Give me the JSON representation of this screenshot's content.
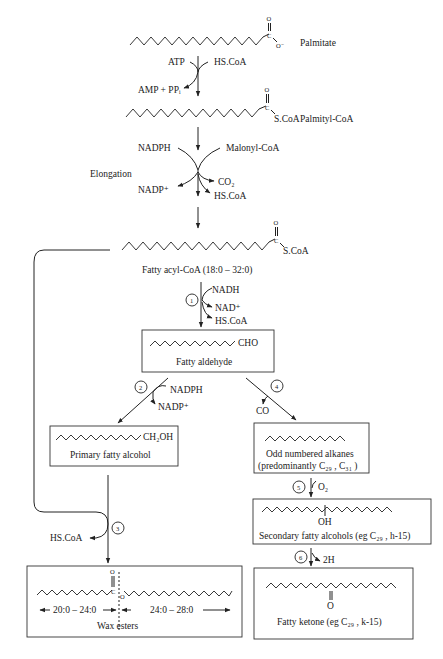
{
  "diagram": {
    "nodes": {
      "palmitate": {
        "label": "Palmitate",
        "group": "O",
        "charge": "O⁻"
      },
      "palmityl_coa": {
        "label": "Palmityl-CoA",
        "group": "S.CoA"
      },
      "fatty_acyl_coa": {
        "label": "Fatty acyl-CoA  (18:0 – 32:0)",
        "group": "S.CoA"
      },
      "fatty_aldehyde": {
        "label": "Fatty aldehyde",
        "group": "CHO"
      },
      "primary_alcohol": {
        "label": "Primary fatty alcohol",
        "group": "CH₂OH"
      },
      "alkanes": {
        "label": "Odd numbered alkanes",
        "sublabel": "(predominantly C₂₉ , C₃₁ )"
      },
      "secondary_alcohols": {
        "label": "Secondary fatty alcohols (eg C₂₉ , h-15)",
        "group": "OH"
      },
      "ketone": {
        "label": "Fatty ketone (eg C₂₉ , k-15)",
        "group": "O"
      },
      "wax_esters": {
        "label": "Wax esters",
        "left_range": "20:0 – 24:0",
        "right_range": "24:0 – 28:0"
      }
    },
    "reactions": {
      "activation": {
        "in": [
          "ATP",
          "HS.CoA"
        ],
        "out": "AMP + PPᵢ"
      },
      "elongation": {
        "label": "Elongation",
        "in": [
          "NADPH",
          "Malonyl-CoA"
        ],
        "out": [
          "NADP⁺",
          "CO₂",
          "HS.CoA"
        ]
      },
      "step1": {
        "number": "1",
        "in": "NADH",
        "out": [
          "NAD⁺",
          "HS.CoA"
        ]
      },
      "step2": {
        "number": "2",
        "in": "NADPH",
        "out": "NADP⁺"
      },
      "step3": {
        "number": "3",
        "out": "HS.CoA"
      },
      "step4": {
        "number": "4",
        "out": "CO"
      },
      "step5": {
        "number": "5",
        "in": "O₂"
      },
      "step6": {
        "number": "6",
        "out": "2H"
      }
    },
    "atoms": {
      "O": "O",
      "C": "C"
    }
  }
}
